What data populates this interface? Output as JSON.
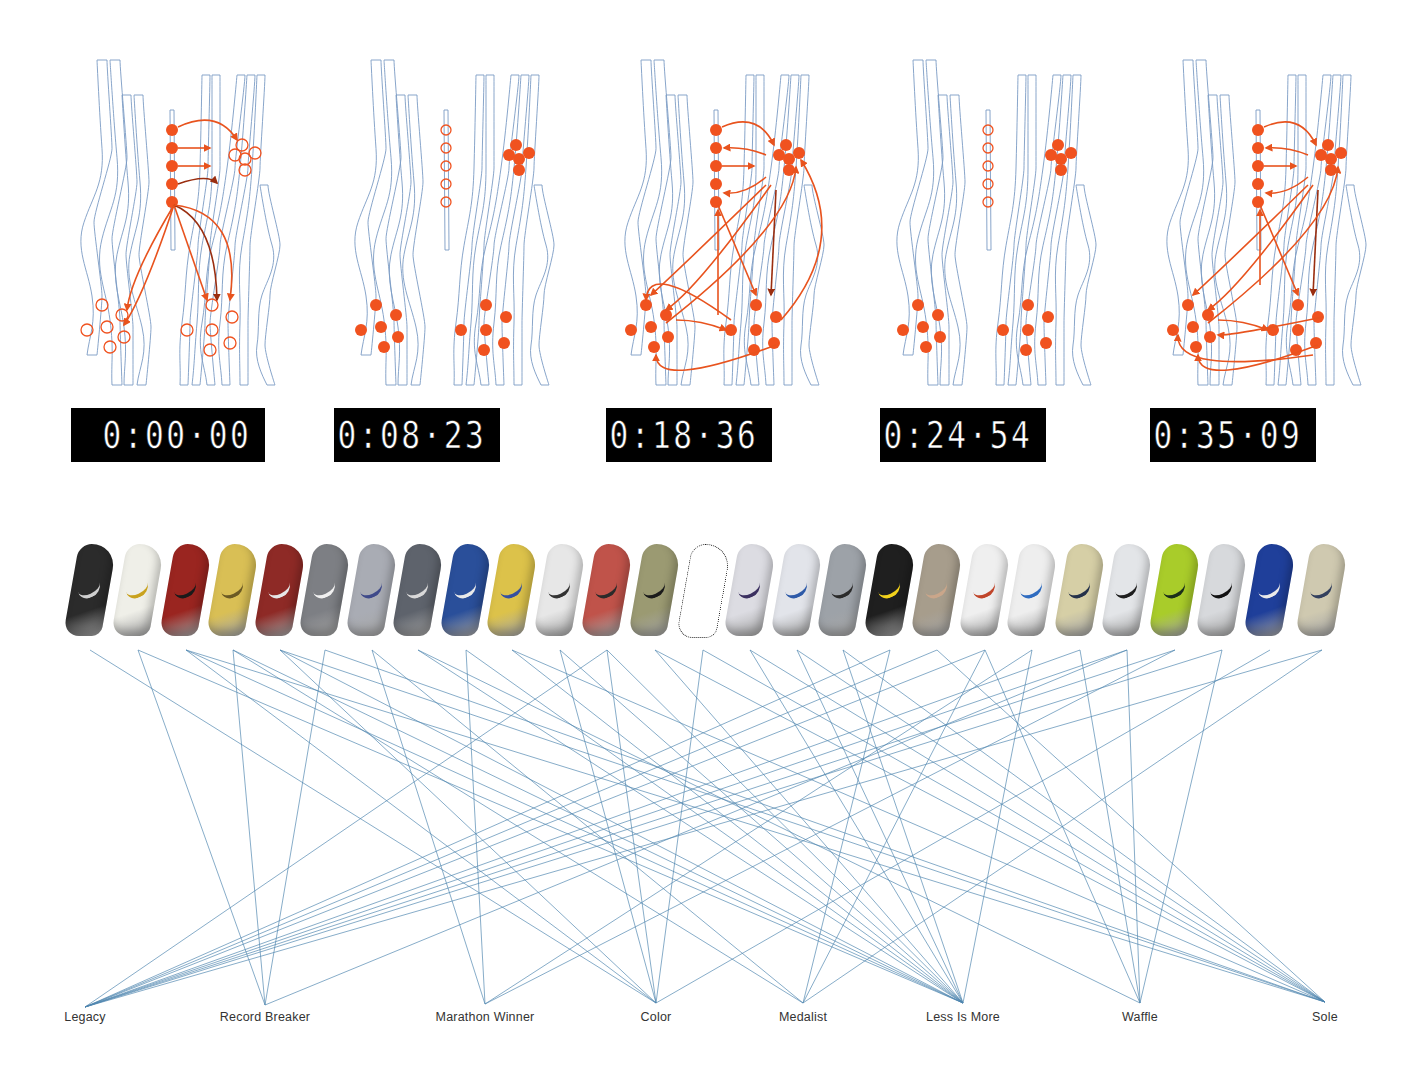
{
  "colors": {
    "bone_stroke": "#7b9bc4",
    "marker_fill": "#f0521f",
    "marker_dark": "#c93a14",
    "arrow": "#e8531e",
    "arrow_dark": "#9a2e10",
    "link": "#4f86b0",
    "timer_bg": "#000000",
    "timer_fg": "#ffffff"
  },
  "panels": [
    {
      "x": 62,
      "timer": "0:00·00",
      "timer_x": 71,
      "timer_w": 194,
      "state": "hollow-targets"
    },
    {
      "x": 336,
      "timer": "0:08·23",
      "timer_x": 334,
      "timer_w": 166,
      "state": "idle"
    },
    {
      "x": 606,
      "timer": "0:18·36",
      "timer_x": 606,
      "timer_w": 166,
      "state": "full-flow"
    },
    {
      "x": 878,
      "timer": "0:24·54",
      "timer_x": 880,
      "timer_w": 166,
      "state": "idle"
    },
    {
      "x": 1148,
      "timer": "0:35·09",
      "timer_x": 1150,
      "timer_w": 166,
      "state": "full-flow-2"
    }
  ],
  "shoes": [
    {
      "x": 90,
      "color": "#2b2b2b",
      "accent": "#cfcfcf"
    },
    {
      "x": 138,
      "color": "#efefe8",
      "accent": "#c9a21e"
    },
    {
      "x": 186,
      "color": "#9a2520",
      "accent": "#1a1a1a"
    },
    {
      "x": 233,
      "color": "#d9bf55",
      "accent": "#6b5a24"
    },
    {
      "x": 280,
      "color": "#8e2a26",
      "accent": "#e6e6e6"
    },
    {
      "x": 325,
      "color": "#7d7f84",
      "accent": "#f0f0f0"
    },
    {
      "x": 372,
      "color": "#a9acb4",
      "accent": "#3f4a8a"
    },
    {
      "x": 418,
      "color": "#5e636c",
      "accent": "#d9d9d9"
    },
    {
      "x": 466,
      "color": "#2a4f9a",
      "accent": "#e9e9e9"
    },
    {
      "x": 512,
      "color": "#dcc24a",
      "accent": "#3550a0"
    },
    {
      "x": 560,
      "color": "#e7e7e7",
      "accent": "#333333"
    },
    {
      "x": 607,
      "color": "#c0534a",
      "accent": "#2a2a2a"
    },
    {
      "x": 655,
      "color": "#9b9a72",
      "accent": "#1b1b1b"
    },
    {
      "x": 703,
      "color": "outline",
      "accent": "#222222"
    },
    {
      "x": 750,
      "color": "#dcdce2",
      "accent": "#3b3060"
    },
    {
      "x": 797,
      "color": "#e2e4ea",
      "accent": "#2e5aa8"
    },
    {
      "x": 843,
      "color": "#9da2a8",
      "accent": "#2b2b2b"
    },
    {
      "x": 890,
      "color": "#1f1f1f",
      "accent": "#f2d21c"
    },
    {
      "x": 937,
      "color": "#a79d8c",
      "accent": "#caa68a"
    },
    {
      "x": 985,
      "color": "#efefef",
      "accent": "#c0452a"
    },
    {
      "x": 1032,
      "color": "#eeeeee",
      "accent": "#2f6cc0"
    },
    {
      "x": 1080,
      "color": "#d6cfa6",
      "accent": "#25324a"
    },
    {
      "x": 1127,
      "color": "#e3e5e8",
      "accent": "#1e1e1e"
    },
    {
      "x": 1175,
      "color": "#a9cc2a",
      "accent": "#1c2f1a"
    },
    {
      "x": 1222,
      "color": "#d7d9dc",
      "accent": "#121212"
    },
    {
      "x": 1270,
      "color": "#1f3f9a",
      "accent": "#eaeaea"
    },
    {
      "x": 1322,
      "color": "#cfc9b0",
      "accent": "#33405e"
    }
  ],
  "categories": [
    {
      "label": "Legacy",
      "x": 85,
      "y": 1007
    },
    {
      "label": "Record Breaker",
      "x": 265,
      "y": 1005
    },
    {
      "label": "Marathon Winner",
      "x": 485,
      "y": 1004
    },
    {
      "label": "Color",
      "x": 656,
      "y": 1003
    },
    {
      "label": "Medalist",
      "x": 803,
      "y": 1003
    },
    {
      "label": "Less Is More",
      "x": 963,
      "y": 1003
    },
    {
      "label": "Waffle",
      "x": 1140,
      "y": 1003
    },
    {
      "label": "Sole",
      "x": 1325,
      "y": 1002
    }
  ],
  "links": [
    [
      0,
      3
    ],
    [
      1,
      1
    ],
    [
      1,
      5
    ],
    [
      2,
      5
    ],
    [
      2,
      3
    ],
    [
      3,
      1
    ],
    [
      3,
      5
    ],
    [
      4,
      3
    ],
    [
      4,
      5
    ],
    [
      5,
      1
    ],
    [
      5,
      7
    ],
    [
      6,
      2
    ],
    [
      7,
      5
    ],
    [
      7,
      6
    ],
    [
      8,
      2
    ],
    [
      9,
      5
    ],
    [
      10,
      3
    ],
    [
      11,
      0
    ],
    [
      11,
      3
    ],
    [
      11,
      5
    ],
    [
      12,
      5
    ],
    [
      12,
      7
    ],
    [
      13,
      7
    ],
    [
      13,
      3
    ],
    [
      14,
      5
    ],
    [
      15,
      5
    ],
    [
      16,
      5
    ],
    [
      17,
      0
    ],
    [
      17,
      4
    ],
    [
      18,
      0
    ],
    [
      18,
      7
    ],
    [
      19,
      0
    ],
    [
      19,
      4
    ],
    [
      19,
      6
    ],
    [
      20,
      2
    ],
    [
      21,
      0
    ],
    [
      21,
      6
    ],
    [
      22,
      0
    ],
    [
      22,
      1
    ],
    [
      22,
      6
    ],
    [
      23,
      0
    ],
    [
      23,
      2
    ],
    [
      24,
      0
    ],
    [
      24,
      6
    ],
    [
      25,
      3
    ],
    [
      26,
      0
    ],
    [
      26,
      4
    ],
    [
      6,
      4
    ],
    [
      9,
      7
    ],
    [
      10,
      5
    ],
    [
      14,
      7
    ],
    [
      15,
      7
    ],
    [
      16,
      7
    ],
    [
      20,
      5
    ],
    [
      8,
      5
    ],
    [
      3,
      4
    ],
    [
      2,
      7
    ],
    [
      4,
      7
    ]
  ]
}
